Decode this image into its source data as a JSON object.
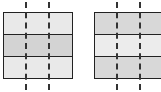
{
  "figures": [
    {
      "name": "left-figure",
      "left": 3,
      "width": 70,
      "bands": [
        {
          "shade": "light",
          "color": "#e9e9e9"
        },
        {
          "shade": "dark",
          "color": "#d3d3d3"
        },
        {
          "shade": "light",
          "color": "#e9e9e9"
        }
      ],
      "dash_x": [
        26,
        49
      ]
    },
    {
      "name": "right-figure",
      "left": 94,
      "width": 70,
      "bands": [
        {
          "shade": "dark",
          "color": "#d8d8d8"
        },
        {
          "shade": "light",
          "color": "#ececec"
        },
        {
          "shade": "dark",
          "color": "#d8d8d8"
        }
      ],
      "dash_x": [
        117,
        140
      ]
    }
  ]
}
